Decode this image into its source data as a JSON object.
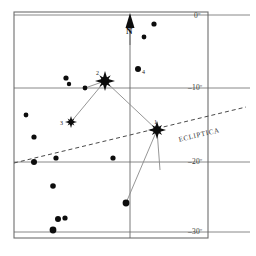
{
  "chart_data": {
    "type": "scatter",
    "title": "",
    "subtitle": "",
    "xlabel": "",
    "ylabel": "Declination",
    "grid": true,
    "legend_position": "none",
    "projection": "equatorial star chart",
    "frame": {
      "x": 14,
      "y": 12,
      "width": 194,
      "height": 226
    },
    "declination_gridlines": [
      {
        "label": "0º",
        "y": 15,
        "label_x": 194,
        "label_y": 12
      },
      {
        "label": "–10º",
        "y": 88,
        "label_x": 188,
        "label_y": 84
      },
      {
        "label": "–20º",
        "y": 162,
        "label_x": 188,
        "label_y": 158
      },
      {
        "label": "–30º",
        "y": 232,
        "label_x": 188,
        "label_y": 228
      }
    ],
    "meridian_line": {
      "x": 130,
      "y1": 15,
      "y2": 238
    },
    "ecliptic": {
      "label": "ECLIPTICA",
      "style": "dashed",
      "x1": 14,
      "y1": 163,
      "x2": 246,
      "y2": 107,
      "label_x": 178,
      "label_y": 137,
      "label_angle": -13.5
    },
    "north_marker": {
      "label": "N",
      "arrow_x": 130,
      "arrow_tip_y": 13,
      "arrow_base_y": 28,
      "label_x": 126,
      "label_y": 27
    },
    "named_stars": [
      {
        "id": "1",
        "label": "1",
        "x": 157,
        "y": 130,
        "magnitude": "bright",
        "glyph": "starburst",
        "size": 9,
        "label_dx": -3,
        "label_dy": -11
      },
      {
        "id": "2",
        "label": "2",
        "x": 105,
        "y": 81,
        "magnitude": "bright",
        "glyph": "starburst",
        "size": 10,
        "label_dx": -9,
        "label_dy": -11
      },
      {
        "id": "3",
        "label": "3",
        "x": 71,
        "y": 122,
        "magnitude": "medium",
        "glyph": "starburst",
        "size": 6,
        "label_dx": -11,
        "label_dy": -2
      },
      {
        "id": "4",
        "label": "4",
        "x": 138,
        "y": 69,
        "magnitude": "medium",
        "glyph": "dot",
        "size": 3,
        "label_dx": 4,
        "label_dy": 0
      }
    ],
    "field_stars": [
      {
        "x": 154,
        "y": 24,
        "r": 2.6
      },
      {
        "x": 144,
        "y": 37,
        "r": 2.4
      },
      {
        "x": 66,
        "y": 78,
        "r": 2.6
      },
      {
        "x": 69,
        "y": 84,
        "r": 2.2
      },
      {
        "x": 85,
        "y": 88,
        "r": 2.4
      },
      {
        "x": 26,
        "y": 115,
        "r": 2.4
      },
      {
        "x": 34,
        "y": 137,
        "r": 2.6
      },
      {
        "x": 34,
        "y": 162,
        "r": 3.0
      },
      {
        "x": 56,
        "y": 158,
        "r": 2.6
      },
      {
        "x": 113,
        "y": 158,
        "r": 2.6
      },
      {
        "x": 53,
        "y": 186,
        "r": 2.8
      },
      {
        "x": 58,
        "y": 219,
        "r": 3.0
      },
      {
        "x": 65,
        "y": 218,
        "r": 2.6
      },
      {
        "x": 53,
        "y": 230,
        "r": 3.4
      },
      {
        "x": 126,
        "y": 203,
        "r": 3.4
      }
    ],
    "constellation_lines": [
      {
        "from": {
          "x": 85,
          "y": 88
        },
        "to": {
          "x": 105,
          "y": 81
        }
      },
      {
        "from": {
          "x": 105,
          "y": 81
        },
        "to": {
          "x": 71,
          "y": 122
        }
      },
      {
        "from": {
          "x": 105,
          "y": 81
        },
        "to": {
          "x": 157,
          "y": 130
        }
      },
      {
        "from": {
          "x": 157,
          "y": 130
        },
        "to": {
          "x": 126,
          "y": 203
        }
      },
      {
        "from": {
          "x": 157,
          "y": 130
        },
        "to": {
          "x": 160,
          "y": 170
        }
      }
    ],
    "caption": ""
  },
  "labels": {
    "dec_0": "0º",
    "dec_10": "–10º",
    "dec_20": "–20º",
    "dec_30": "–30º",
    "ecliptic": "ECLIPTICA",
    "north": "N",
    "star_1": "1",
    "star_2": "2",
    "star_3": "3",
    "star_4": "4"
  },
  "colors": {
    "background": "#ffffff",
    "frame": "#6e6e6e",
    "gridline": "#6a6a6a",
    "star": "#0d0d0d",
    "constellation_line": "#8a8a8a",
    "ecliptic_line": "#4a4a4a",
    "text": "#2a2a2a"
  }
}
